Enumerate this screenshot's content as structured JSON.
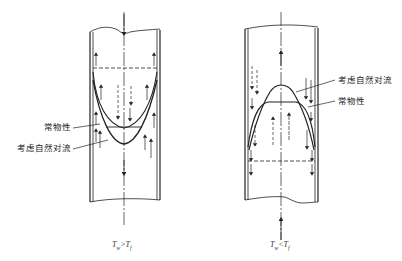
{
  "figure": {
    "left_panel": {
      "condition": "T_w > T_f",
      "caption": {
        "T1": "T",
        "sub1": "w",
        "op": ">",
        "T2": "T",
        "sub2": "f"
      },
      "labels": {
        "constant_properties": "常物性",
        "natural_convection": "考虑自然对流"
      },
      "main_flow_direction": "down"
    },
    "right_panel": {
      "condition": "T_w < T_f",
      "caption": {
        "T1": "T",
        "sub1": "w",
        "op": "<",
        "T2": "T",
        "sub2": "f"
      },
      "labels": {
        "natural_convection": "考虑自然对流",
        "constant_properties": "常物性"
      },
      "main_flow_direction": "up"
    },
    "colors": {
      "ink": "#222222",
      "background": "#ffffff"
    }
  }
}
